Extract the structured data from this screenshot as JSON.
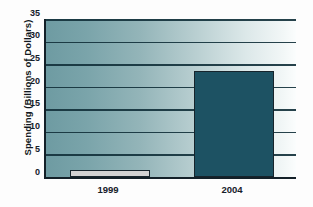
{
  "chart_data": {
    "type": "bar",
    "title": "",
    "xlabel": "",
    "ylabel": "Spending (Billions of Dollars)",
    "categories": [
      "1999",
      "2004"
    ],
    "values": [
      1.5,
      23.5
    ],
    "series": [
      {
        "name": "Spending",
        "values": [
          1.5,
          23.5
        ]
      }
    ],
    "ylim": [
      0,
      35
    ],
    "ytick_labels": [
      "0",
      "5",
      "10",
      "15",
      "20",
      "25",
      "30",
      "35"
    ],
    "ytick_values": [
      0,
      5,
      10,
      15,
      20,
      25,
      30,
      35
    ],
    "grid": true,
    "legend": "none",
    "bar_colors": [
      "#d2d2d2",
      "#1d5263"
    ],
    "plot_background": "teal-to-white-horizontal-gradient",
    "axis_color": "#132028",
    "gridline_color": "#14323c"
  }
}
